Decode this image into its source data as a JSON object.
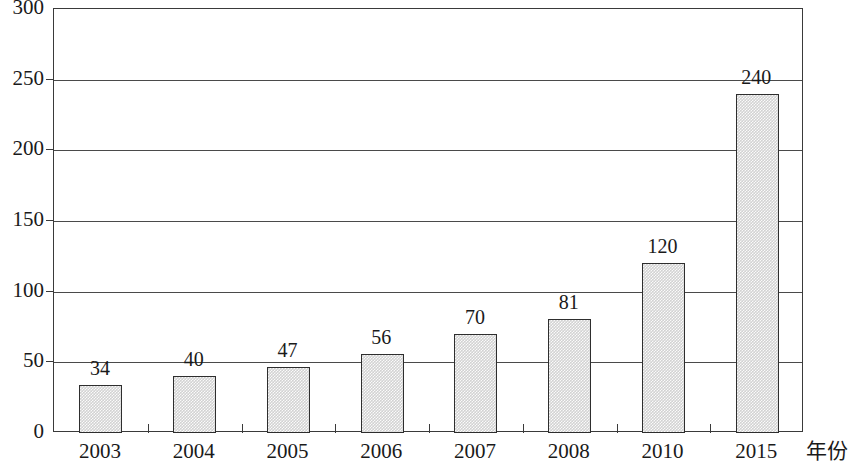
{
  "chart_data": {
    "type": "bar",
    "title": "",
    "xlabel": "年份",
    "ylabel": "",
    "categories": [
      "2003",
      "2004",
      "2005",
      "2006",
      "2007",
      "2008",
      "2010",
      "2015"
    ],
    "values": [
      34,
      40,
      47,
      56,
      70,
      81,
      120,
      240
    ],
    "data_labels": [
      "34",
      "40",
      "47",
      "56",
      "70",
      "81",
      "120",
      "240"
    ],
    "ylim": [
      0,
      300
    ],
    "y_ticks": [
      0,
      50,
      100,
      150,
      200,
      250,
      300
    ],
    "y_tick_labels": [
      "0",
      "50",
      "100",
      "150",
      "200",
      "250",
      "300"
    ],
    "grid": true,
    "legend": "none",
    "bar_fill_color": "#d2d2d2",
    "bar_border_color": "#2e2e2e",
    "axis_color": "#3a3a3a",
    "text_color": "#1a1a1a"
  }
}
